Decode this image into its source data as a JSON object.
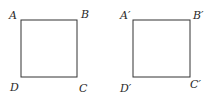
{
  "diagram": {
    "squares": [
      {
        "name": "ABCD",
        "x": 21,
        "y": 20,
        "size": 56,
        "labels": {
          "A": "A",
          "B": "B",
          "C": "C",
          "D": "D"
        }
      },
      {
        "name": "A'B'C'D'",
        "x": 133,
        "y": 20,
        "size": 57,
        "labels": {
          "A": "A′",
          "B": "B′",
          "C": "C′",
          "D": "D′"
        }
      }
    ],
    "stroke_color": "#333333"
  }
}
